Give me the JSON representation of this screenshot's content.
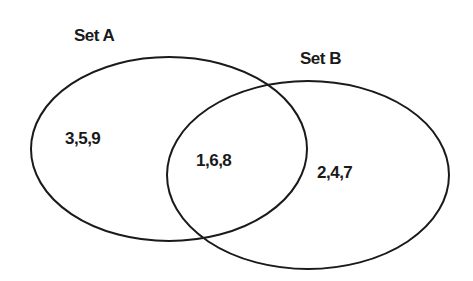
{
  "diagram": {
    "type": "venn",
    "sets": [
      {
        "name": "Set A",
        "only_elements": "3,5,9"
      },
      {
        "name": "Set B",
        "only_elements": "2,4,7"
      }
    ],
    "intersection": "1,6,8",
    "colors": {
      "stroke": "#1a1a1a",
      "text": "#1a1a1a",
      "background": "#ffffff"
    }
  }
}
